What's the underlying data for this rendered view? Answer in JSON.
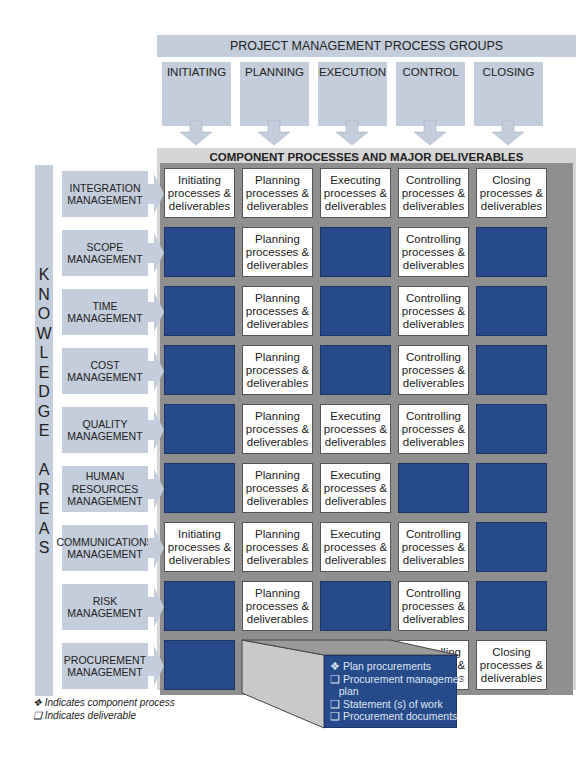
{
  "header": {
    "title": "PROJECT MANAGEMENT PROCESS GROUPS",
    "groups": [
      "INITIATING",
      "PLANNING",
      "EXECUTION",
      "CONTROL",
      "CLOSING"
    ]
  },
  "grid": {
    "title": "COMPONENT PROCESSES AND MAJOR DELIVERABLES",
    "colors": {
      "filled": "#274a8a",
      "header_box": "#c4cddb",
      "band": "#8f8f8f"
    },
    "vertical_label": [
      "K",
      "N",
      "O",
      "W",
      "L",
      "E",
      "D",
      "G",
      "E",
      "",
      "A",
      "R",
      "E",
      "A",
      "S"
    ],
    "rows": [
      {
        "label": [
          "INTEGRATION",
          "MANAGEMENT"
        ],
        "cells": [
          [
            "Initiating",
            "processes &",
            "deliverables"
          ],
          [
            "Planning",
            "processes &",
            "deliverables"
          ],
          [
            "Executing",
            "processes &",
            "deliverables"
          ],
          [
            "Controlling",
            "processes &",
            "deliverables"
          ],
          [
            "Closing",
            "processes &",
            "deliverables"
          ]
        ]
      },
      {
        "label": [
          "SCOPE",
          "MANAGEMENT"
        ],
        "cells": [
          null,
          [
            "Planning",
            "processes &",
            "deliverables"
          ],
          null,
          [
            "Controlling",
            "processes &",
            "deliverables"
          ],
          null
        ]
      },
      {
        "label": [
          "TIME",
          "MANAGEMENT"
        ],
        "cells": [
          null,
          [
            "Planning",
            "processes &",
            "deliverables"
          ],
          null,
          [
            "Controlling",
            "processes &",
            "deliverables"
          ],
          null
        ]
      },
      {
        "label": [
          "COST",
          "MANAGEMENT"
        ],
        "cells": [
          null,
          [
            "Planning",
            "processes &",
            "deliverables"
          ],
          null,
          [
            "Controlling",
            "processes &",
            "deliverables"
          ],
          null
        ]
      },
      {
        "label": [
          "QUALITY",
          "MANAGEMENT"
        ],
        "cells": [
          null,
          [
            "Planning",
            "processes &",
            "deliverables"
          ],
          [
            "Executing",
            "processes &",
            "deliverables"
          ],
          [
            "Controlling",
            "processes &",
            "deliverables"
          ],
          null
        ]
      },
      {
        "label": [
          "HUMAN",
          "RESOURCES",
          "MANAGEMENT"
        ],
        "cells": [
          null,
          [
            "Planning",
            "processes &",
            "deliverables"
          ],
          [
            "Executing",
            "processes &",
            "deliverables"
          ],
          null,
          null
        ]
      },
      {
        "label": [
          "COMMUNICATIONS",
          "MANAGEMENT"
        ],
        "cells": [
          [
            "Initiating",
            "processes &",
            "deliverables"
          ],
          [
            "Planning",
            "processes &",
            "deliverables"
          ],
          [
            "Executing",
            "processes &",
            "deliverables"
          ],
          [
            "Controlling",
            "processes &",
            "deliverables"
          ],
          null
        ]
      },
      {
        "label": [
          "RISK",
          "MANAGEMENT"
        ],
        "cells": [
          null,
          [
            "Planning",
            "processes &",
            "deliverables"
          ],
          null,
          [
            "Controlling",
            "processes &",
            "deliverables"
          ],
          null
        ]
      },
      {
        "label": [
          "PROCUREMENT",
          "MANAGEMENT"
        ],
        "cells": [
          null,
          [
            "Planning",
            "processes &",
            "deliverables"
          ],
          [
            "Executing",
            "processes &",
            "deliverables"
          ],
          [
            "Controlling",
            "processes &",
            "deliverables"
          ],
          [
            "Closing",
            "processes &",
            "deliverables"
          ]
        ]
      }
    ]
  },
  "callout": {
    "items": [
      "❖ Plan procurements",
      "❑ Procurement management",
      "   plan",
      "❑ Statement (s) of work",
      "❑ Procurement documents"
    ]
  },
  "legend": {
    "process": "❖ Indicates component process",
    "deliverable": "❑ Indicates deliverable"
  }
}
